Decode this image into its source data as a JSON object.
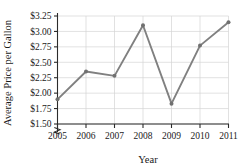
{
  "chart_data": {
    "type": "line",
    "title": "",
    "subtitle": "",
    "xlabel": "Year",
    "ylabel": "Average Price per Gallon",
    "categories": [
      "2005",
      "2006",
      "2007",
      "2008",
      "2009",
      "2010",
      "2011"
    ],
    "x": [
      2005,
      2006,
      2007,
      2008,
      2009,
      2010,
      2011
    ],
    "values": [
      1.9,
      2.35,
      2.28,
      3.1,
      1.83,
      2.77,
      3.15
    ],
    "series": [
      {
        "name": "Average Price per Gallon",
        "values": [
          1.9,
          2.35,
          2.28,
          3.1,
          1.83,
          2.77,
          3.15
        ]
      }
    ],
    "xlim": [
      2005,
      2011
    ],
    "ylim": [
      1.5,
      3.25
    ],
    "ytick_values": [
      1.5,
      1.75,
      2.0,
      2.25,
      2.5,
      2.75,
      3.0,
      3.25
    ],
    "ytick_labels": [
      "$1.50",
      "$1.75",
      "$2.00",
      "$2.25",
      "$2.50",
      "$2.75",
      "$3.00",
      "$3.25"
    ],
    "xtick_labels": [
      "2005",
      "2006",
      "2007",
      "2008",
      "2009",
      "2010",
      "2011"
    ],
    "grid": true,
    "grid_horizontal": true,
    "grid_vertical": true,
    "legend": false,
    "legend_position": "none",
    "axis_break_y": true,
    "markers": "circle",
    "annotations": []
  },
  "style": {
    "line_color": "#808080",
    "marker_color": "#707070",
    "grid_color": "#d4d4d4",
    "axis_color": "#2b2b2b",
    "text_color": "#1a1a1a",
    "background": "#ffffff"
  }
}
